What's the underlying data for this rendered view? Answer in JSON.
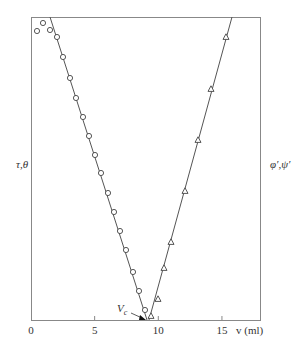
{
  "chart_data": {
    "type": "scatter",
    "title": "",
    "xlabel": "v (ml)",
    "ylabel_left": "τ,θ",
    "ylabel_right": "φ′,ψ′",
    "xlim": [
      0,
      18.2
    ],
    "x_ticks": [
      0,
      5,
      10,
      15
    ],
    "x_tick_labels": [
      "0",
      "5",
      "10",
      "15"
    ],
    "grid": false,
    "annotation": {
      "text": "V",
      "subscript": "c",
      "x": 8.8
    },
    "series": [
      {
        "name": "τ,θ (circles)",
        "marker": "circle",
        "points_px": [
          [
            37,
            31
          ],
          [
            43,
            23
          ],
          [
            50,
            30
          ],
          [
            57,
            37
          ],
          [
            63,
            57
          ],
          [
            70,
            78
          ],
          [
            76,
            98
          ],
          [
            83,
            117
          ],
          [
            89,
            136
          ],
          [
            95,
            155
          ],
          [
            101,
            173
          ],
          [
            108,
            193
          ],
          [
            114,
            212
          ],
          [
            120,
            231
          ],
          [
            126,
            250
          ],
          [
            133,
            272
          ],
          [
            139,
            291
          ],
          [
            145,
            310
          ]
        ],
        "x": [
          0.5,
          0.9,
          1.5,
          2.0,
          2.5,
          3.1,
          3.6,
          4.1,
          4.6,
          5.0,
          5.5,
          6.1,
          6.5,
          7.0,
          7.5,
          8.0,
          8.5,
          9.0
        ],
        "fit_line_px": [
          [
            50,
            17
          ],
          [
            147,
            320
          ]
        ]
      },
      {
        "name": "φ′,ψ′ (triangles)",
        "marker": "triangle",
        "points_px": [
          [
            151,
            316
          ],
          [
            158,
            299
          ],
          [
            164,
            268
          ],
          [
            171,
            242
          ],
          [
            185,
            191
          ],
          [
            198,
            140
          ],
          [
            211,
            89
          ],
          [
            226,
            37
          ]
        ],
        "x": [
          9.4,
          10.0,
          10.5,
          11.0,
          12.1,
          13.1,
          14.2,
          15.4
        ],
        "fit_line_px": [
          [
            149,
            320
          ],
          [
            232,
            17
          ]
        ]
      }
    ]
  }
}
